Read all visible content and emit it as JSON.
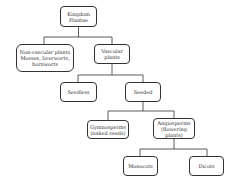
{
  "diagram": {
    "type": "tree",
    "nodes": {
      "kingdom": "Kingdom\nPlantae",
      "nonvascular": "Non-vascular plants\nMosses, liverworts,\nhornworts",
      "vascular": "Vascular\nplants",
      "seedless": "Seedless",
      "seeded": "Seeded",
      "gymnosperms": "Gymnosperms\n(naked seeds)",
      "angiosperms": "Angiosperms\n(flowering\nplants)",
      "monocots": "Monocots",
      "dicots": "Dicots"
    },
    "edges": [
      [
        "kingdom",
        "nonvascular"
      ],
      [
        "kingdom",
        "vascular"
      ],
      [
        "vascular",
        "seedless"
      ],
      [
        "vascular",
        "seeded"
      ],
      [
        "seeded",
        "gymnosperms"
      ],
      [
        "seeded",
        "angiosperms"
      ],
      [
        "angiosperms",
        "monocots"
      ],
      [
        "angiosperms",
        "dicots"
      ]
    ]
  }
}
